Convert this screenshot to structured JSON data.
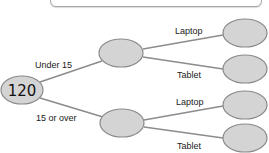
{
  "diagram": {
    "type": "probability-tree",
    "root": {
      "value": "120"
    },
    "level1": [
      {
        "label": "Under 15",
        "value": ""
      },
      {
        "label": "15 or over",
        "value": ""
      }
    ],
    "level2": [
      {
        "parent": "Under 15",
        "label": "Laptop",
        "value": ""
      },
      {
        "parent": "Under 15",
        "label": "Tablet",
        "value": ""
      },
      {
        "parent": "15 or over",
        "label": "Laptop",
        "value": ""
      },
      {
        "parent": "15 or over",
        "label": "Tablet",
        "value": ""
      }
    ],
    "colors": {
      "node_fill": "#d4d4d4",
      "node_stroke": "#8a8a8a",
      "branch_line": "#8c8c8c",
      "box_border": "#a8a8a8"
    }
  }
}
